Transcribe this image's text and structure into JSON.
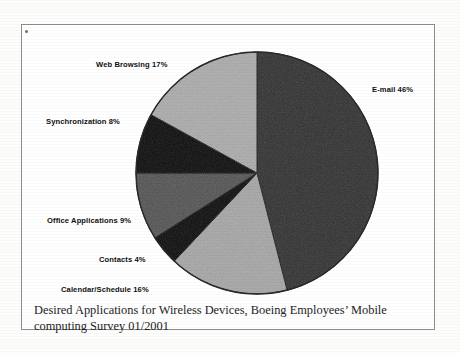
{
  "figure": {
    "caption": "Desired Applications for Wireless Devices, Boeing Employees’ Mobile computing Survey 01/2001"
  },
  "chart_data": {
    "type": "pie",
    "title": "",
    "subtitle": "",
    "xlabel": "",
    "ylabel": "",
    "legend_position": "none",
    "labels_position": "outside",
    "start_angle_deg": 0,
    "direction": "clockwise",
    "units": "percent",
    "categories": [
      "E-mail",
      "Calendar/Schedule",
      "Contacts",
      "Office Applications",
      "Synchronization",
      "Web Browsing"
    ],
    "values": [
      46,
      16,
      4,
      9,
      8,
      17
    ],
    "total": 100,
    "slices": [
      {
        "name": "E-mail",
        "value": 46,
        "label": "E-mail 46%",
        "color": "#3b3b3b",
        "start_deg": 0,
        "end_deg": 165.6
      },
      {
        "name": "Calendar/Schedule",
        "value": 16,
        "label": "Calendar/Schedule 16%",
        "color": "#a9a9a9",
        "start_deg": 165.6,
        "end_deg": 223.2
      },
      {
        "name": "Contacts",
        "value": 4,
        "label": "Contacts 4%",
        "color": "#131313",
        "start_deg": 223.2,
        "end_deg": 237.6
      },
      {
        "name": "Office Applications",
        "value": 9,
        "label": "Office Applications 9%",
        "color": "#5b5b5b",
        "start_deg": 237.6,
        "end_deg": 270.0
      },
      {
        "name": "Synchronization",
        "value": 8,
        "label": "Synchronization 8%",
        "color": "#131313",
        "start_deg": 270.0,
        "end_deg": 298.8
      },
      {
        "name": "Web Browsing",
        "value": 17,
        "label": "Web Browsing 17%",
        "color": "#aeaeae",
        "start_deg": 298.8,
        "end_deg": 360.0
      }
    ],
    "geometry": {
      "center_x": 257,
      "center_y": 173,
      "radius": 121
    },
    "colors": {
      "outline": "#2a2a2a",
      "background": "#ffffff",
      "label_text": "#111111"
    }
  }
}
